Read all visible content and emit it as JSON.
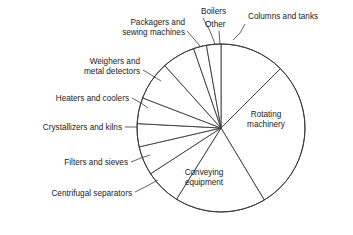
{
  "chart_data": {
    "type": "pie",
    "title": "",
    "subtitle": "",
    "xlabel": "",
    "ylabel": "",
    "legend_position": "none",
    "grid": false,
    "label_style": "leader-lines-outside-and-inside",
    "categories": [
      "Columns and tanks",
      "Rotating machinery",
      "Conveying equipment",
      "Centrifugal separators",
      "Filters and sieves",
      "Crystallizers and kilns",
      "Heaters and coolers",
      "Weighers and metal detectors",
      "Packagers and sewing machines",
      "Boilers",
      "Other"
    ],
    "values": [
      12.5,
      29.0,
      17.5,
      7.0,
      5.5,
      4.5,
      5.0,
      7.5,
      6.5,
      2.5,
      2.5
    ],
    "units": "percent",
    "slices": [
      {
        "label": "Columns and tanks",
        "value": 12.5,
        "start_deg": 0,
        "end_deg": 45,
        "label_placement": "outside",
        "label_x": 248,
        "label_y": 19,
        "anchor": "start",
        "lines": [
          "Columns and tanks"
        ],
        "leader": [
          [
            245,
            24
          ],
          [
            240,
            33
          ],
          [
            233,
            40
          ]
        ]
      },
      {
        "label": "Rotating machinery",
        "value": 29.0,
        "start_deg": 45,
        "end_deg": 149,
        "label_placement": "inside",
        "label_x": 266,
        "label_y": 117,
        "anchor": "middle",
        "lines": [
          "Rotating",
          "machinery"
        ],
        "leader": []
      },
      {
        "label": "Conveying equipment",
        "value": 17.5,
        "start_deg": 149,
        "end_deg": 212,
        "label_placement": "inside",
        "label_x": 204,
        "label_y": 175,
        "anchor": "middle",
        "lines": [
          "Conveying",
          "equipment"
        ],
        "leader": []
      },
      {
        "label": "Centrifugal separators",
        "value": 7.0,
        "start_deg": 212,
        "end_deg": 237,
        "label_placement": "outside",
        "label_x": 132,
        "label_y": 196,
        "anchor": "end",
        "lines": [
          "Centrifugal separators"
        ],
        "leader": [
          [
            135,
            192
          ],
          [
            147,
            186
          ],
          [
            158,
            180
          ]
        ]
      },
      {
        "label": "Filters and sieves",
        "value": 5.5,
        "start_deg": 237,
        "end_deg": 257,
        "label_placement": "outside",
        "label_x": 128,
        "label_y": 165,
        "anchor": "end",
        "lines": [
          "Filters and sieves"
        ],
        "leader": [
          [
            131,
            162
          ],
          [
            141,
            158
          ],
          [
            150,
            155
          ]
        ]
      },
      {
        "label": "Crystallizers and kilns",
        "value": 4.5,
        "start_deg": 257,
        "end_deg": 273,
        "label_placement": "outside",
        "label_x": 122,
        "label_y": 130,
        "anchor": "end",
        "lines": [
          "Crystallizers and kilns"
        ],
        "leader": [
          [
            125,
            127
          ],
          [
            137,
            127
          ]
        ]
      },
      {
        "label": "Heaters and coolers",
        "value": 5.0,
        "start_deg": 273,
        "end_deg": 291,
        "label_placement": "outside",
        "label_x": 129,
        "label_y": 101,
        "anchor": "end",
        "lines": [
          "Heaters and coolers"
        ],
        "leader": [
          [
            132,
            98
          ],
          [
            141,
            103
          ],
          [
            148,
            108
          ]
        ]
      },
      {
        "label": "Weighers and metal detectors",
        "value": 7.5,
        "start_deg": 291,
        "end_deg": 318,
        "label_placement": "outside",
        "label_x": 140,
        "label_y": 64,
        "anchor": "end",
        "lines": [
          "Weighers and",
          "metal detectors"
        ],
        "leader": [
          [
            143,
            70
          ],
          [
            153,
            76
          ],
          [
            161,
            81
          ]
        ]
      },
      {
        "label": "Packagers and sewing machines",
        "value": 6.5,
        "start_deg": 318,
        "end_deg": 341,
        "label_placement": "outside",
        "label_x": 185,
        "label_y": 25,
        "anchor": "end",
        "lines": [
          "Packagers and",
          "sewing machines"
        ],
        "leader": [
          [
            187,
            31
          ],
          [
            194,
            39
          ],
          [
            200,
            46
          ]
        ]
      },
      {
        "label": "Boilers",
        "value": 2.5,
        "start_deg": 341,
        "end_deg": 350,
        "label_placement": "outside",
        "label_x": 201,
        "label_y": 14,
        "anchor": "start",
        "lines": [
          "Boilers"
        ],
        "leader": [
          [
            203,
            18
          ],
          [
            210,
            31
          ],
          [
            215,
            44
          ]
        ]
      },
      {
        "label": "Other",
        "value": 2.5,
        "start_deg": 350,
        "end_deg": 360,
        "label_placement": "outside",
        "label_x": 205,
        "label_y": 27,
        "anchor": "start",
        "lines": [
          "Other"
        ],
        "leader": [
          [
            219,
            31
          ],
          [
            220,
            44
          ]
        ]
      }
    ],
    "geometry": {
      "cx": 221,
      "cy": 128,
      "r": 84,
      "rotation_note": "0 deg = 12 o'clock, clockwise"
    },
    "colors": {
      "slice_fill": "#ffffff",
      "slice_stroke": "#3a3a3a",
      "text": "#1a1a1a",
      "background": "#ffffff"
    }
  }
}
